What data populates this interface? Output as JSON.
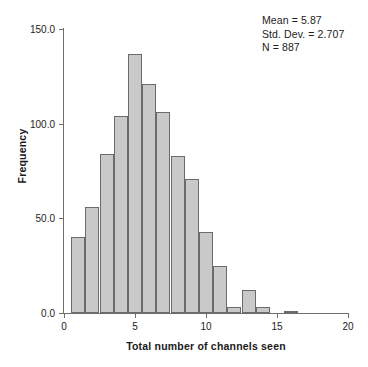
{
  "chart_data": {
    "type": "bar",
    "title": "",
    "subtitle": "",
    "xlabel": "Total number of channels seen",
    "ylabel": "Frequency",
    "xlim": [
      0,
      20
    ],
    "ylim": [
      0,
      150
    ],
    "xticks": [
      0,
      5,
      10,
      15,
      20
    ],
    "xtick_labels": [
      "0",
      "5",
      "10",
      "15",
      "20"
    ],
    "yticks": [
      0,
      50,
      100,
      150
    ],
    "ytick_labels": [
      "0.0",
      "50.0",
      "100.0",
      "150.0"
    ],
    "grid": false,
    "legend": null,
    "bin_width": 1,
    "bin_edges": [
      0.5,
      1.5,
      2.5,
      3.5,
      4.5,
      5.5,
      6.5,
      7.5,
      8.5,
      9.5,
      10.5,
      11.5,
      12.5,
      13.5,
      14.5,
      15.5,
      16.5
    ],
    "categories": [
      "1",
      "2",
      "3",
      "4",
      "5",
      "6",
      "7",
      "8",
      "9",
      "10",
      "11",
      "12",
      "13",
      "14",
      "15",
      "16"
    ],
    "values": [
      40,
      56,
      84,
      104,
      137,
      121,
      106,
      83,
      71,
      43,
      25,
      3,
      12,
      3,
      0,
      1
    ],
    "bar_fill_color": "#c9c9c9",
    "bar_edge_color": "#6b6b6b",
    "axis_color": "#6e6e6e",
    "text_color": "#1c1c1c",
    "background_color": "#ffffff",
    "annotations": [
      "Mean = 5.87",
      "Std. Dev. = 2.707",
      "N = 887"
    ]
  },
  "stats": {
    "mean": "Mean = 5.87",
    "std_dev": "Std. Dev. = 2.707",
    "n": "N = 887"
  },
  "axes": {
    "x_title": "Total number of channels seen",
    "y_title": "Frequency"
  }
}
